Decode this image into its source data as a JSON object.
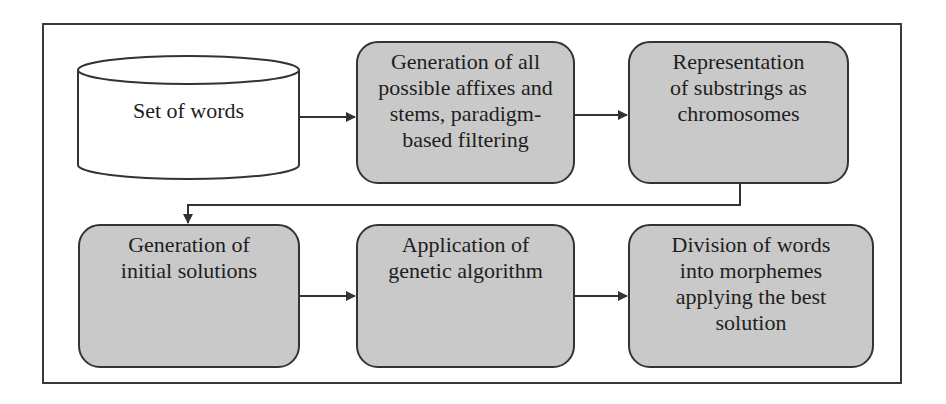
{
  "diagram": {
    "type": "flowchart",
    "nodes": {
      "set_of_words": {
        "shape": "cylinder",
        "label": "Set of words"
      },
      "generation_affixes": {
        "shape": "rounded-rect",
        "lines": [
          "Generation of all",
          "possible affixes and",
          "stems, paradigm-",
          "based filtering"
        ]
      },
      "representation": {
        "shape": "rounded-rect",
        "lines": [
          "Representation",
          "of substrings as",
          "chromosomes"
        ]
      },
      "initial_solutions": {
        "shape": "rounded-rect",
        "lines": [
          "Generation of",
          "initial solutions"
        ]
      },
      "genetic_algorithm": {
        "shape": "rounded-rect",
        "lines": [
          "Application of",
          "genetic algorithm"
        ]
      },
      "division": {
        "shape": "rounded-rect",
        "lines": [
          "Division of words",
          "into morphemes",
          "applying the best",
          "solution"
        ]
      }
    },
    "edges": [
      [
        "set_of_words",
        "generation_affixes"
      ],
      [
        "generation_affixes",
        "representation"
      ],
      [
        "representation",
        "initial_solutions"
      ],
      [
        "initial_solutions",
        "genetic_algorithm"
      ],
      [
        "genetic_algorithm",
        "division"
      ]
    ],
    "colors": {
      "node_fill": "#c9c9c9",
      "stroke": "#333333",
      "background": "#ffffff"
    }
  }
}
